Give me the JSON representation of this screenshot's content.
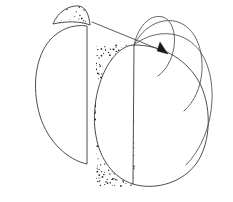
{
  "figure": {
    "canvas": {
      "width": 233,
      "height": 202,
      "background": "#ffffff"
    },
    "style": {
      "stroke_color": "#3a3a3a",
      "stroke_color_soft": "#4a4a4a",
      "arrow_color": "#1a1a1a",
      "stipple_color": "#262626",
      "fill_color": "#ffffff",
      "stroke_width": 0.9
    },
    "parts": [
      {
        "id": "left-body",
        "name": "left-half-body",
        "label": "Left sectioned half body",
        "description": "Large lens / D shape with straight vertical cut face on the right and a bulging curved outline on the left",
        "path": "M 87 26 L 87 164 C 68 160 48 142 40 116 C 31 86 36 56 50 40 C 60 29 73 24 87 26 Z",
        "cut_edge": {
          "x": 87,
          "y_top": 26,
          "y_bottom": 164
        },
        "stippled": false
      },
      {
        "id": "left-sliver",
        "name": "detached-rind-sliver",
        "label": "Detached stippled rind sliver",
        "description": "Thin crescent cap of rind removed from the top of the left body, filled with stipple dots",
        "path": "M 53 24 C 58 11 70 5 79 6 C 86 7 89 15 90 25 C 80 21 66 21 53 24 Z",
        "stippled": true
      },
      {
        "id": "right-body",
        "name": "right-whole-body",
        "label": "Right whole body with peeled flaps",
        "description": "Large oval divided by a vertical line; left half stippled flesh, right half white with three peeled rind flaps",
        "outline_path": "M 134 45 C 160 45 184 57 198 80 C 212 104 212 142 196 164 C 180 185 152 190 133 184 C 114 178 100 160 96 136 C 91 110 98 77 112 59 C 118 51 126 45 134 45 Z",
        "divider": {
          "x_top": 134,
          "y_top": 45,
          "x_bottom": 133,
          "y_bottom": 184
        },
        "stippled_half": "left"
      }
    ],
    "flaps": [
      {
        "id": "flap-1",
        "name": "peel-flap-inner",
        "label": "Inner peeled rind flap",
        "path": "M 134 45 C 139 23 152 14 163 17 C 172 20 176 33 174 47 C 172 60 166 70 158 76"
      },
      {
        "id": "flap-2",
        "name": "peel-flap-middle",
        "label": "Middle peeled rind flap",
        "path": "M 134 45 C 144 25 163 17 178 22 C 195 28 203 48 202 70 C 201 88 194 102 184 111"
      },
      {
        "id": "flap-3",
        "name": "peel-flap-outer",
        "label": "Outer peeled rind flap",
        "path": "M 134 45 C 150 32 172 30 188 40 C 206 51 213 76 212 100 C 211 126 201 150 186 165"
      }
    ],
    "arrow": {
      "id": "transfer-arrow",
      "name": "transfer-arrow",
      "label": "Arrow indicating the sliver is transferred onto the right body",
      "shaft_path": "M 92 22 L 163 51",
      "head_points": "168,54 157,51 160,42",
      "from_part": "left-sliver",
      "to_part": "right-body"
    },
    "stipple": {
      "sliver_seed": 11,
      "sliver_dot_count": 26,
      "sliver_dot_radius": 0.65,
      "body_seed": 29,
      "body_dot_count": 430,
      "body_dot_radius": 0.62,
      "body_region": {
        "x_min": 94,
        "x_max": 134,
        "y_min": 45,
        "y_max": 186
      }
    }
  }
}
